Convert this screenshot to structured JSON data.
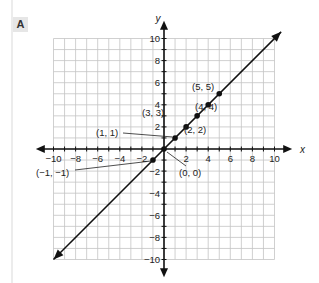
{
  "panel": {
    "label": "A"
  },
  "chart_data": {
    "type": "line",
    "title": "",
    "xlabel": "x",
    "ylabel": "y",
    "xlim": [
      -10,
      10
    ],
    "ylim": [
      -10,
      10
    ],
    "grid": true,
    "x_ticks": [
      "−10",
      "−8",
      "−6",
      "−4",
      "−2",
      "2",
      "4",
      "6",
      "8",
      "10"
    ],
    "y_ticks": [
      "10",
      "8",
      "6",
      "4",
      "2",
      "−2",
      "−4",
      "−6",
      "−8",
      "−10"
    ],
    "series": [
      {
        "name": "y = x",
        "line": "y = x",
        "arrows_both_ends": true,
        "points": [
          [
            -1,
            -1
          ],
          [
            0,
            0
          ],
          [
            1,
            1
          ],
          [
            2,
            2
          ],
          [
            3,
            3
          ],
          [
            4,
            4
          ],
          [
            5,
            5
          ]
        ]
      }
    ],
    "annotations": [
      {
        "text": "(−1, −1)",
        "x": -1,
        "y": -1
      },
      {
        "text": "(0, 0)",
        "x": 0,
        "y": 0
      },
      {
        "text": "(1, 1)",
        "x": 1,
        "y": 1
      },
      {
        "text": "(2, 2)",
        "x": 2,
        "y": 2
      },
      {
        "text": "(3, 3)",
        "x": 3,
        "y": 3
      },
      {
        "text": "(4, 4)",
        "x": 4,
        "y": 4
      },
      {
        "text": "(5, 5)",
        "x": 5,
        "y": 5
      }
    ]
  }
}
